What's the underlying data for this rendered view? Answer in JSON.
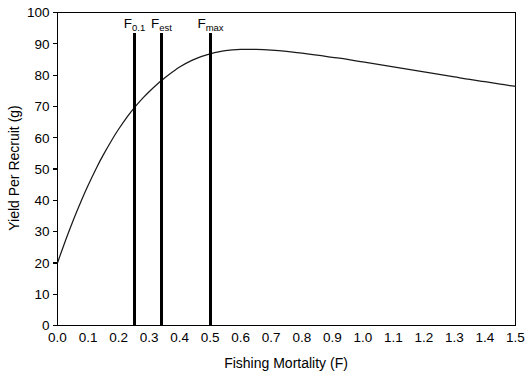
{
  "chart_data": {
    "type": "line",
    "title": "",
    "xlabel": "Fishing Mortality (F)",
    "ylabel": "Yield Per Recruit (g)",
    "xlim": [
      0.0,
      1.5
    ],
    "ylim": [
      0,
      100
    ],
    "grid": false,
    "legend": "none",
    "x_ticks": [
      "0.0",
      "0.1",
      "0.2",
      "0.3",
      "0.4",
      "0.5",
      "0.6",
      "0.7",
      "0.8",
      "0.9",
      "1.0",
      "1.1",
      "1.2",
      "1.3",
      "1.4",
      "1.5"
    ],
    "x_tick_values": [
      0.0,
      0.1,
      0.2,
      0.3,
      0.4,
      0.5,
      0.6,
      0.7,
      0.8,
      0.9,
      1.0,
      1.1,
      1.2,
      1.3,
      1.4,
      1.5
    ],
    "y_ticks": [
      "0",
      "10",
      "20",
      "30",
      "40",
      "50",
      "60",
      "70",
      "80",
      "90",
      "100"
    ],
    "y_tick_values": [
      0,
      10,
      20,
      30,
      40,
      50,
      60,
      70,
      80,
      90,
      100
    ],
    "series": [
      {
        "name": "Yield per recruit",
        "x": [
          0.0,
          0.02,
          0.05,
          0.08,
          0.1,
          0.13,
          0.15,
          0.18,
          0.2,
          0.23,
          0.25,
          0.28,
          0.3,
          0.33,
          0.34,
          0.36,
          0.4,
          0.44,
          0.47,
          0.5,
          0.55,
          0.6,
          0.65,
          0.7,
          0.75,
          0.8,
          0.85,
          0.9,
          0.95,
          1.0,
          1.05,
          1.1,
          1.15,
          1.2,
          1.25,
          1.3,
          1.35,
          1.4,
          1.45,
          1.5
        ],
        "y": [
          20.0,
          25.5,
          33.2,
          40.3,
          44.7,
          50.8,
          54.5,
          59.6,
          62.7,
          66.9,
          69.4,
          72.7,
          74.7,
          77.4,
          78.2,
          79.8,
          82.6,
          84.7,
          85.9,
          86.8,
          87.8,
          88.2,
          88.2,
          88.0,
          87.6,
          87.0,
          86.4,
          85.7,
          85.0,
          84.2,
          83.4,
          82.6,
          81.8,
          81.0,
          80.2,
          79.4,
          78.6,
          77.9,
          77.1,
          76.4
        ]
      }
    ],
    "reference_lines": [
      {
        "id": "f01",
        "label_main": "F",
        "label_sub": "0.1",
        "value": 0.25,
        "top_value": 93.5
      },
      {
        "id": "fest",
        "label_main": "F",
        "label_sub": "est",
        "value": 0.34,
        "top_value": 93.5
      },
      {
        "id": "fmax",
        "label_main": "F",
        "label_sub": "max",
        "value": 0.5,
        "top_value": 93.5
      }
    ],
    "annotations": [
      "F_0.1 reference line at F = 0.25",
      "F_est reference line at F = 0.34",
      "F_max reference line at F = 0.50 (curve maximum, approx 88 g)"
    ],
    "colors": {
      "curve": "#1a1a1a",
      "axis": "#000000",
      "reference_line": "#000000",
      "background": "#ffffff"
    }
  }
}
